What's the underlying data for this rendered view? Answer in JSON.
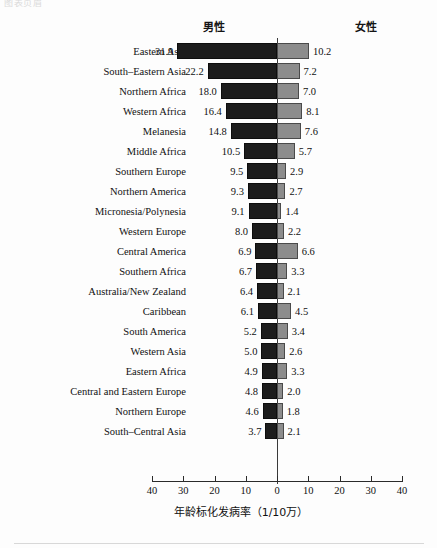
{
  "scan_artifact_text": "图表页眉",
  "headers": {
    "male": "男性",
    "female": "女性"
  },
  "axis": {
    "title": "年龄标化发病率（1/10万）",
    "tick_labels": [
      "40",
      "30",
      "20",
      "10",
      "0",
      "10",
      "20",
      "30",
      "40"
    ]
  },
  "colors": {
    "male_bar": "#1c1c1c",
    "female_bar": "#8c8c8c",
    "axis": "#2b2b2b",
    "text": "#111111"
  },
  "chart_data": {
    "type": "bar",
    "orientation": "horizontal-diverging",
    "title": "",
    "xlabel": "年龄标化发病率（1/10万）",
    "ylabel": "",
    "xlim": [
      -40,
      40
    ],
    "xticks": [
      -40,
      -30,
      -20,
      -10,
      0,
      10,
      20,
      30,
      40
    ],
    "xtick_labels": [
      "40",
      "30",
      "20",
      "10",
      "0",
      "10",
      "20",
      "30",
      "40"
    ],
    "grid": false,
    "legend_position": "top",
    "categories": [
      "Eastern Asia",
      "South–Eastern Asia",
      "Northern Africa",
      "Western Africa",
      "Melanesia",
      "Middle Africa",
      "Southern Europe",
      "Northern America",
      "Micronesia/Polynesia",
      "Western Europe",
      "Central America",
      "Southern Africa",
      "Australia/New Zealand",
      "Caribbean",
      "South America",
      "Western Asia",
      "Eastern Africa",
      "Central and Eastern Europe",
      "Northern Europe",
      "South–Central Asia"
    ],
    "series": [
      {
        "name": "男性",
        "color": "#1c1c1c",
        "direction": "left",
        "values": [
          31.9,
          22.2,
          18.0,
          16.4,
          14.8,
          10.5,
          9.5,
          9.3,
          9.1,
          8.0,
          6.9,
          6.7,
          6.4,
          6.1,
          5.2,
          5.0,
          4.9,
          4.8,
          4.6,
          3.7
        ],
        "labels": [
          "31.9",
          "22.2",
          "18.0",
          "16.4",
          "14.8",
          "10.5",
          "9.5",
          "9.3",
          "9.1",
          "8.0",
          "6.9",
          "6.7",
          "6.4",
          "6.1",
          "5.2",
          "5.0",
          "4.9",
          "4.8",
          "4.6",
          "3.7"
        ]
      },
      {
        "name": "女性",
        "color": "#8c8c8c",
        "direction": "right",
        "values": [
          10.2,
          7.2,
          7.0,
          8.1,
          7.6,
          5.7,
          2.9,
          2.7,
          1.4,
          2.2,
          6.6,
          3.3,
          2.1,
          4.5,
          3.4,
          2.6,
          3.3,
          2.0,
          1.8,
          2.1
        ],
        "labels": [
          "10.2",
          "7.2",
          "7.0",
          "8.1",
          "7.6",
          "5.7",
          "2.9",
          "2.7",
          "1.4",
          "2.2",
          "6.6",
          "3.3",
          "2.1",
          "4.5",
          "3.4",
          "2.6",
          "3.3",
          "2.0",
          "1.8",
          "2.1"
        ]
      }
    ]
  }
}
